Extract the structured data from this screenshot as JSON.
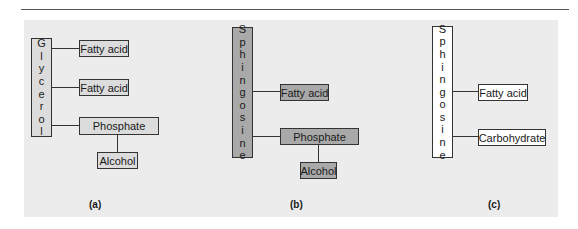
{
  "figure": {
    "panels": [
      {
        "label": "(a)",
        "backbone": "Glycerol",
        "backbone_letters": [
          "G",
          "l",
          "y",
          "c",
          "e",
          "r",
          "o",
          "l"
        ],
        "fill": "#dcdcdc",
        "attachments": [
          "Fatty acid",
          "Fatty acid",
          "Phosphate"
        ],
        "sub_attachment": {
          "parent": "Phosphate",
          "label": "Alcohol"
        }
      },
      {
        "label": "(b)",
        "backbone": "Sphingosine",
        "backbone_letters": [
          "S",
          "p",
          "h",
          "i",
          "n",
          "g",
          "o",
          "s",
          "i",
          "n",
          "e"
        ],
        "fill": "#a9a9a9",
        "attachments": [
          "Fatty acid",
          "Phosphate"
        ],
        "sub_attachment": {
          "parent": "Phosphate",
          "label": "Alcohol"
        }
      },
      {
        "label": "(c)",
        "backbone": "Sphingosine",
        "backbone_letters": [
          "S",
          "p",
          "h",
          "i",
          "n",
          "g",
          "o",
          "s",
          "i",
          "n",
          "e"
        ],
        "fill": "#ffffff",
        "attachments": [
          "Fatty acid",
          "Carbohydrate"
        ]
      }
    ]
  }
}
